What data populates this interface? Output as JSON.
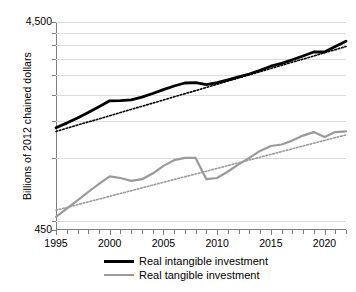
{
  "chart_data": {
    "type": "line",
    "title": "",
    "xlabel": "",
    "ylabel": "Billions of 2012 chained dollars",
    "yscale": "log",
    "ylim": [
      450,
      4500
    ],
    "ytick_labels": [
      "4,500",
      "450"
    ],
    "grid": true,
    "legend_position": "bottom-center",
    "x": [
      1995,
      1996,
      1997,
      1998,
      1999,
      2000,
      2001,
      2002,
      2003,
      2004,
      2005,
      2006,
      2007,
      2008,
      2009,
      2010,
      2011,
      2012,
      2013,
      2014,
      2015,
      2016,
      2017,
      2018,
      2019,
      2020,
      2021,
      2022
    ],
    "xtick_labels": [
      "1995",
      "2000",
      "2005",
      "2010",
      "2015",
      "2020"
    ],
    "xticks": [
      1995,
      2000,
      2005,
      2010,
      2015,
      2020
    ],
    "series": [
      {
        "name": "Real intangible investment",
        "color": "#000000",
        "values": [
          1395,
          1470,
          1555,
          1650,
          1760,
          1880,
          1885,
          1900,
          1960,
          2040,
          2130,
          2215,
          2290,
          2300,
          2250,
          2300,
          2370,
          2450,
          2530,
          2640,
          2760,
          2850,
          2960,
          3090,
          3230,
          3230,
          3430,
          3640
        ],
        "trendline": {
          "type": "exponential",
          "color": "#000000",
          "style": "dotted",
          "start_value": 1340,
          "end_value": 3430
        }
      },
      {
        "name": "Real tangible investment",
        "color": "#9a9a9a",
        "values": [
          520,
          570,
          625,
          685,
          750,
          815,
          800,
          775,
          790,
          840,
          915,
          975,
          1000,
          1000,
          790,
          800,
          860,
          930,
          1000,
          1080,
          1140,
          1160,
          1210,
          1280,
          1330,
          1260,
          1330,
          1340
        ],
        "trendline": {
          "type": "exponential",
          "color": "#9a9a9a",
          "style": "dotted",
          "start_value": 560,
          "end_value": 1290
        }
      }
    ]
  },
  "legend": {
    "items": [
      {
        "label": "Real intangible investment",
        "color": "#000000"
      },
      {
        "label": "Real tangible investment",
        "color": "#9a9a9a"
      }
    ]
  }
}
